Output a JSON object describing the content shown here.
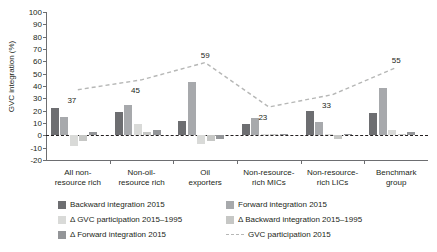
{
  "chart_data": {
    "type": "bar",
    "title": "",
    "xlabel": "",
    "ylabel": "GVC integration (%)",
    "ylim": [
      -20,
      100
    ],
    "ytick_labels": [
      "100",
      "90",
      "80",
      "70",
      "60",
      "50",
      "40",
      "30",
      "20",
      "10",
      "0",
      "-10",
      "-20"
    ],
    "yticks": [
      100,
      90,
      80,
      70,
      60,
      50,
      40,
      30,
      20,
      10,
      0,
      -10,
      -20
    ],
    "grid": false,
    "legend_position": "bottom",
    "categories": [
      "All non-resource rich",
      "Non-oil-resource rich",
      "Oil exporters",
      "Non-resource-rich MICs",
      "Non-resource-rich LICs",
      "Benchmark group"
    ],
    "category_lines": [
      [
        "All non-",
        "resource rich"
      ],
      [
        "Non-oil-",
        "resource rich"
      ],
      [
        "Oil",
        "exporters"
      ],
      [
        "Non-resource-",
        "rich MICs"
      ],
      [
        "Non-resource-",
        "rich LICs"
      ],
      [
        "Benchmark",
        "group"
      ]
    ],
    "series": [
      {
        "name": "Backward integration 2015",
        "type": "bar",
        "color": "#6d6e71",
        "values": [
          22,
          19,
          12,
          9,
          20,
          18
        ]
      },
      {
        "name": "Forward integration 2015",
        "type": "bar",
        "color": "#a7a9ac",
        "values": [
          15,
          25,
          43,
          14,
          11,
          38
        ]
      },
      {
        "name": "Δ GVC participation 2015–1995",
        "type": "bar",
        "color": "#d9dad8",
        "values": [
          -9,
          9,
          -7,
          1,
          1,
          4
        ]
      },
      {
        "name": "Δ Backward integration 2015–1995",
        "type": "bar",
        "color": "#c6c7c5",
        "values": [
          -5,
          3,
          -5,
          1,
          -3,
          1
        ]
      },
      {
        "name": "Δ Forward integration 2015",
        "type": "bar",
        "color": "#939598",
        "values": [
          3,
          4,
          -3,
          1,
          1,
          3
        ]
      },
      {
        "name": "GVC participation 2015",
        "type": "line",
        "style": "dashed",
        "color": "#b6b7b6",
        "values": [
          37,
          45,
          59,
          23,
          33,
          55
        ],
        "point_labels": [
          "37",
          "45",
          "59",
          "23",
          "33",
          "55"
        ]
      }
    ]
  },
  "legend": {
    "items": [
      {
        "label": "Backward integration 2015",
        "swatch": "#6d6e71",
        "kind": "box"
      },
      {
        "label": "Forward integration 2015",
        "swatch": "#a7a9ac",
        "kind": "box"
      },
      {
        "label": "Δ GVC participation 2015–1995",
        "swatch": "#d9dad8",
        "kind": "box"
      },
      {
        "label": "Δ Backward integration 2015–1995",
        "swatch": "#c6c7c5",
        "kind": "box"
      },
      {
        "label": "Δ Forward integration 2015",
        "swatch": "#939598",
        "kind": "box"
      },
      {
        "label": "GVC participation 2015",
        "swatch": "#b6b7b6",
        "kind": "dash"
      }
    ]
  }
}
